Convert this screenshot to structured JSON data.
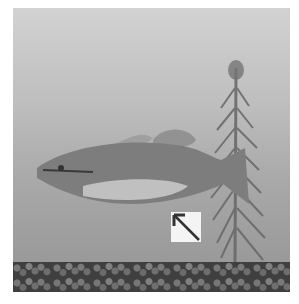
{
  "scene": {
    "subject": "fish",
    "elements": [
      "fish",
      "aquatic-plant",
      "gravel-substrate",
      "arrow-icon"
    ],
    "colors": {
      "water_top": "#d2d2d2",
      "water_bottom": "#9a9a9a",
      "gravel": "#3f3f3f",
      "fish_body": "#7d7d7d",
      "fish_belly": "#c8c8c8",
      "plant": "#6f6f6f",
      "icon_bg": "#f4f4f4",
      "icon_arrow": "#333333"
    }
  }
}
